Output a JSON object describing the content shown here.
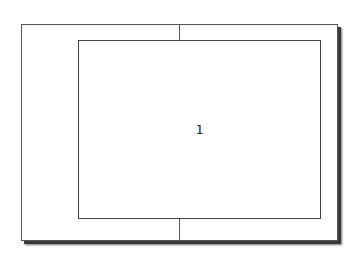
{
  "diagram": {
    "inner_panel": {
      "label": "1"
    },
    "colors": {
      "background": "#ffffff",
      "border": "#555555",
      "shadow": "#3a3a3a",
      "text": "#222222"
    }
  }
}
